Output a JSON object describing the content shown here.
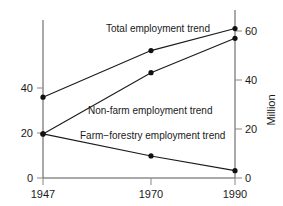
{
  "chart_data": {
    "type": "line",
    "title": "",
    "subtitle": "",
    "xlabel": "",
    "ylabel": "",
    "right_axis_label": "Million",
    "x": [
      "1947",
      "1970",
      "1990"
    ],
    "categories": [
      "1947",
      "1970",
      "1990"
    ],
    "xlim": [
      1947,
      1990
    ],
    "ylim": [
      0,
      65
    ],
    "left_axis_ticks": [
      "0",
      "20",
      "40"
    ],
    "left_axis_tick_values": [
      0,
      20,
      40
    ],
    "right_axis_ticks": [
      "0",
      "20",
      "40",
      "60"
    ],
    "right_axis_tick_values": [
      0,
      20,
      40,
      60
    ],
    "grid": false,
    "legend_position": "inline-annotations",
    "series": [
      {
        "name": "Total employment trend",
        "values": [
          33,
          52,
          61
        ]
      },
      {
        "name": "Non-farm employment trend",
        "values": [
          18,
          43,
          57
        ]
      },
      {
        "name": "Farm−forestry employment trend",
        "values": [
          18,
          9,
          3
        ]
      }
    ],
    "annotations": [
      {
        "text": "Total employment trend",
        "x": 106,
        "y": 32
      },
      {
        "text": "Non-farm employment trend",
        "x": 88,
        "y": 114
      },
      {
        "text": "Farm−forestry employment trend",
        "x": 80,
        "y": 139
      }
    ]
  },
  "axes": {
    "left": {
      "ticks": [
        {
          "label": "40",
          "y": 88
        },
        {
          "label": "20",
          "y": 133
        },
        {
          "label": "0",
          "y": 178
        }
      ]
    },
    "right": {
      "label": "Million",
      "ticks": [
        {
          "label": "60",
          "y": 31
        },
        {
          "label": "40",
          "y": 80
        },
        {
          "label": "20",
          "y": 129
        },
        {
          "label": "0",
          "y": 178
        }
      ]
    },
    "bottom": {
      "ticks": [
        {
          "label": "1947",
          "x": 43
        },
        {
          "label": "1970",
          "x": 151
        },
        {
          "label": "1990",
          "x": 235
        }
      ]
    }
  }
}
